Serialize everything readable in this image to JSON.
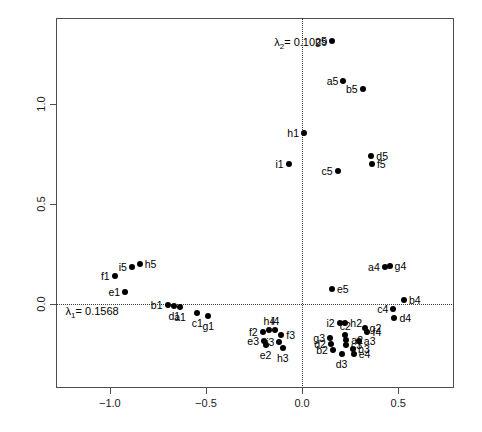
{
  "chart_data": {
    "type": "scatter",
    "title": "",
    "xlabel": "",
    "ylabel": "",
    "xlim": [
      -1.28,
      0.79
    ],
    "ylim": [
      -0.42,
      1.43
    ],
    "xticks": [
      "-1.0",
      "-0.5",
      "0.0",
      "0.5"
    ],
    "xtick_values": [
      -1.0,
      -0.5,
      0.0,
      0.5
    ],
    "yticks": [
      "0.0",
      "0.5",
      "1.0"
    ],
    "ytick_values": [
      0.0,
      0.5,
      1.0
    ],
    "grid": false,
    "legend": "none",
    "reference_lines": [
      {
        "name": "horizontal-zero-line",
        "axis": "y",
        "value": 0.0,
        "style": "dotted"
      },
      {
        "name": "vertical-zero-line",
        "axis": "x",
        "value": 0.0,
        "style": "dotted"
      }
    ],
    "annotations": [
      {
        "name": "lambda1-annotation",
        "text": "λ₁= 0.1568",
        "sub": "1",
        "prefix": "λ",
        "suffix": "= 0.1568",
        "x": -1.23,
        "y": -0.035
      },
      {
        "name": "lambda2-annotation",
        "text": "λ₂= 0.1029",
        "sub": "2",
        "prefix": "λ",
        "suffix": "= 0.1029",
        "x": -0.145,
        "y": 1.31
      }
    ],
    "point_color": "#000000",
    "points": [
      {
        "label": "g5",
        "x": 0.155,
        "y": 1.315,
        "lpos": "left"
      },
      {
        "label": "a5",
        "x": 0.215,
        "y": 1.115,
        "lpos": "left"
      },
      {
        "label": "b5",
        "x": 0.315,
        "y": 1.075,
        "lpos": "left"
      },
      {
        "label": "h1",
        "x": 0.01,
        "y": 0.855,
        "lpos": "left"
      },
      {
        "label": "i1",
        "x": -0.07,
        "y": 0.7,
        "lpos": "left"
      },
      {
        "label": "c5",
        "x": 0.185,
        "y": 0.665,
        "lpos": "left"
      },
      {
        "label": "d5",
        "x": 0.36,
        "y": 0.742,
        "lpos": "right"
      },
      {
        "label": "f5",
        "x": 0.363,
        "y": 0.7,
        "lpos": "right"
      },
      {
        "label": "i5",
        "x": -0.885,
        "y": 0.185,
        "lpos": "left"
      },
      {
        "label": "h5",
        "x": -0.845,
        "y": 0.2,
        "lpos": "right"
      },
      {
        "label": "f1",
        "x": -0.975,
        "y": 0.14,
        "lpos": "left"
      },
      {
        "label": "a4",
        "x": 0.43,
        "y": 0.185,
        "lpos": "left"
      },
      {
        "label": "g4",
        "x": 0.455,
        "y": 0.19,
        "lpos": "right"
      },
      {
        "label": "e5",
        "x": 0.155,
        "y": 0.075,
        "lpos": "right"
      },
      {
        "label": "e1",
        "x": -0.92,
        "y": 0.06,
        "lpos": "left"
      },
      {
        "label": "b4",
        "x": 0.53,
        "y": 0.02,
        "lpos": "right"
      },
      {
        "label": "c4",
        "x": 0.475,
        "y": -0.025,
        "lpos": "left"
      },
      {
        "label": "b1",
        "x": -0.7,
        "y": -0.005,
        "lpos": "left"
      },
      {
        "label": "d1",
        "x": -0.665,
        "y": -0.01,
        "lpos": "below"
      },
      {
        "label": "a1",
        "x": -0.635,
        "y": -0.015,
        "lpos": "below"
      },
      {
        "label": "c1",
        "x": -0.545,
        "y": -0.045,
        "lpos": "below"
      },
      {
        "label": "g1",
        "x": -0.488,
        "y": -0.058,
        "lpos": "below"
      },
      {
        "label": "d4",
        "x": 0.48,
        "y": -0.07,
        "lpos": "right"
      },
      {
        "label": "i2",
        "x": 0.195,
        "y": -0.093,
        "lpos": "left"
      },
      {
        "label": "h2",
        "x": 0.225,
        "y": -0.095,
        "lpos": "right"
      },
      {
        "label": "g2",
        "x": 0.325,
        "y": -0.118,
        "lpos": "right"
      },
      {
        "label": "f4",
        "x": 0.34,
        "y": -0.142,
        "lpos": "right"
      },
      {
        "label": "h4",
        "x": -0.17,
        "y": -0.132,
        "lpos": "above"
      },
      {
        "label": "i4",
        "x": -0.14,
        "y": -0.132,
        "lpos": "above"
      },
      {
        "label": "f2",
        "x": -0.205,
        "y": -0.14,
        "lpos": "left"
      },
      {
        "label": "f3",
        "x": -0.108,
        "y": -0.155,
        "lpos": "right"
      },
      {
        "label": "c2",
        "x": 0.225,
        "y": -0.155,
        "lpos": "above"
      },
      {
        "label": "g3",
        "x": 0.145,
        "y": -0.168,
        "lpos": "left"
      },
      {
        "label": "a2",
        "x": 0.23,
        "y": -0.18,
        "lpos": "right"
      },
      {
        "label": "a3",
        "x": 0.295,
        "y": -0.185,
        "lpos": "right"
      },
      {
        "label": "e3",
        "x": -0.198,
        "y": -0.183,
        "lpos": "left"
      },
      {
        "label": "e2",
        "x": -0.19,
        "y": -0.205,
        "lpos": "below"
      },
      {
        "label": "i3",
        "x": -0.118,
        "y": -0.19,
        "lpos": "left"
      },
      {
        "label": "d2",
        "x": 0.15,
        "y": -0.198,
        "lpos": "left"
      },
      {
        "label": "c3",
        "x": 0.228,
        "y": -0.205,
        "lpos": "right"
      },
      {
        "label": "h3",
        "x": -0.1,
        "y": -0.222,
        "lpos": "below"
      },
      {
        "label": "b2",
        "x": 0.16,
        "y": -0.228,
        "lpos": "left"
      },
      {
        "label": "b3",
        "x": 0.265,
        "y": -0.225,
        "lpos": "right"
      },
      {
        "label": "d3",
        "x": 0.205,
        "y": -0.25,
        "lpos": "below"
      },
      {
        "label": "e4",
        "x": 0.268,
        "y": -0.252,
        "lpos": "right"
      }
    ]
  }
}
